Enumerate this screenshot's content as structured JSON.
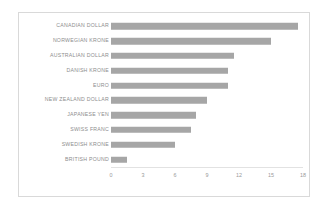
{
  "chart_data": {
    "type": "bar",
    "orientation": "horizontal",
    "title": "",
    "xlabel": "",
    "ylabel": "",
    "categories": [
      "CANADIAN DOLLAR",
      "NORWEGIAN KRONE",
      "AUSTRALIAN DOLLAR",
      "DANISH KRONE",
      "EURO",
      "NEW ZEALAND DOLLAR",
      "JAPANESE YEN",
      "SWISS FRANC",
      "SWEDISH KRONE",
      "BRITISH POUND"
    ],
    "values": [
      17.5,
      15,
      11.5,
      11,
      11,
      9,
      8,
      7.5,
      6,
      1.5
    ],
    "xticks": [
      "0",
      "3",
      "6",
      "9",
      "12",
      "15",
      "18"
    ],
    "xtick_values": [
      0,
      3,
      6,
      9,
      12,
      15,
      18
    ],
    "xlim": [
      0,
      18
    ],
    "grid": false,
    "legend": null,
    "bar_color": "#a6a6a6",
    "text_color": "#8d8d8d",
    "border_color": "#d9d9d9",
    "background_color": "#ffffff"
  }
}
